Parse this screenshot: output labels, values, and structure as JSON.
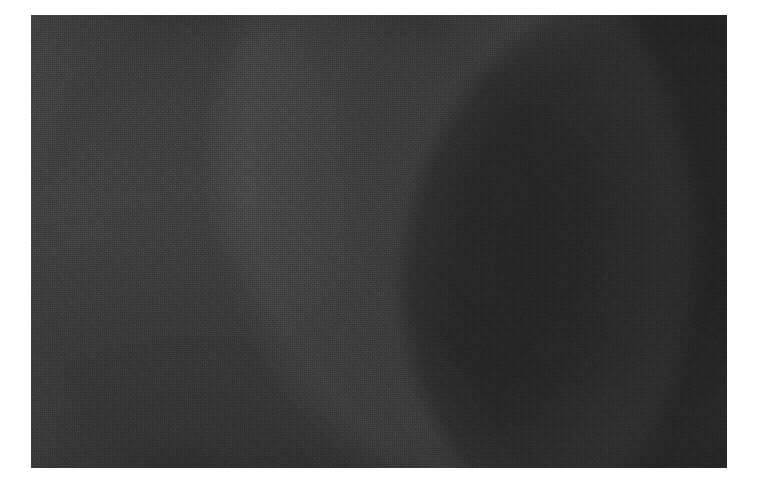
{
  "page": {
    "background_color": "#ffffff",
    "width": 760,
    "height": 486,
    "caption": ""
  },
  "photo": {
    "title": "",
    "alt_text": "Very dark monochrome abstract photograph with a large shadowed circular form",
    "frame": {
      "left": 31,
      "top": 15,
      "width": 696,
      "height": 453
    },
    "palette": {
      "matte": "#ffffff",
      "field_dark": "#383838",
      "field_mid": "#3c3c3c",
      "crescent_light": "#4a4a4a",
      "disc_darkest": "#2c2c2c",
      "edge_shadow": "#2a2a2a"
    },
    "regions": [
      {
        "name": "background-field",
        "tone": "#383838",
        "description": "Flat dark grey field occupying the left and upper portion of the frame"
      },
      {
        "name": "crescent-band",
        "tone": "#4a4a4a",
        "description": "Lighter crescent-shaped band arcing from the top edge near x=300, bowing left to about x=265 at mid-height, then curving back right toward the bottom edge"
      },
      {
        "name": "dark-disc",
        "tone": "#2c2c2c",
        "description": "Large very dark circular form filling the right half, its left rim arcing from the top edge near x=425 through x=418 at mid-height down past x=470 near the bottom; it extends beyond the right and bottom edges"
      },
      {
        "name": "grain-overlay",
        "tone": "",
        "description": "Heavy monochrome halftone / dither texture covering the entire photograph"
      }
    ]
  },
  "chart_data": null
}
